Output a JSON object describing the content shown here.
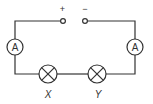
{
  "diagram": {
    "type": "series circuit",
    "colors": {
      "line": "#333333",
      "background": "#ffffff"
    },
    "supply": {
      "positive_label": "+",
      "negative_label": "−"
    },
    "ammeters": [
      {
        "id": "left",
        "symbol": "A"
      },
      {
        "id": "right",
        "symbol": "A"
      }
    ],
    "lamps": [
      {
        "id": "X",
        "label": "X"
      },
      {
        "id": "Y",
        "label": "Y"
      }
    ]
  }
}
